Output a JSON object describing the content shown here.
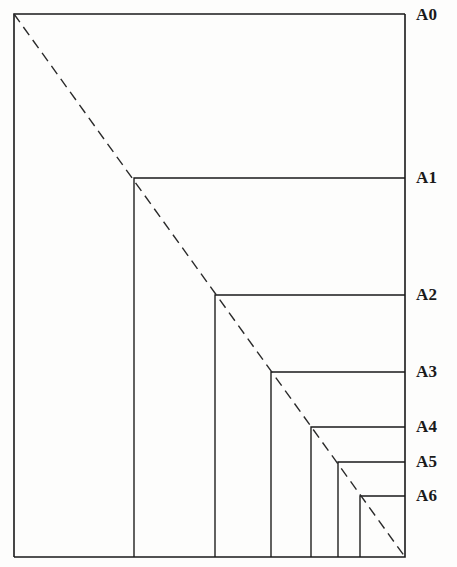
{
  "figure": {
    "kind": "a-series-paper-size-nested-rectangles",
    "background_color": "#fdfdfc",
    "line_color": "#1a1a1a",
    "label_color": "#1a1a1a",
    "canvas": {
      "width": 457,
      "height": 567
    }
  },
  "frame": {
    "left": 14,
    "top": 14,
    "right": 405,
    "bottom": 557,
    "stroke_width": 1.6
  },
  "diagonal": {
    "name": "dashed-diagonal",
    "x1": 14,
    "y1": 14,
    "x2": 405,
    "y2": 557,
    "dash": "10 6",
    "stroke_width": 1.4,
    "color": "#2a2a2a"
  },
  "labels": [
    {
      "id": "A0",
      "text": "A0",
      "x": 416,
      "y": 6
    },
    {
      "id": "A1",
      "text": "A1",
      "x": 416,
      "y": 169
    },
    {
      "id": "A2",
      "text": "A2",
      "x": 416,
      "y": 286
    },
    {
      "id": "A3",
      "text": "A3",
      "x": 416,
      "y": 363
    },
    {
      "id": "A4",
      "text": "A4",
      "x": 416,
      "y": 418
    },
    {
      "id": "A5",
      "text": "A5",
      "x": 416,
      "y": 453
    },
    {
      "id": "A6",
      "text": "A6",
      "x": 416,
      "y": 487
    }
  ],
  "rectangles": [
    {
      "id": "A0",
      "corner_x": 14,
      "corner_y": 14,
      "right": 405,
      "bottom": 557
    },
    {
      "id": "A1",
      "corner_x": 134,
      "corner_y": 178,
      "right": 405,
      "bottom": 557
    },
    {
      "id": "A2",
      "corner_x": 215,
      "corner_y": 295,
      "right": 405,
      "bottom": 557
    },
    {
      "id": "A3",
      "corner_x": 271,
      "corner_y": 372,
      "right": 405,
      "bottom": 557
    },
    {
      "id": "A4",
      "corner_x": 311,
      "corner_y": 427,
      "right": 405,
      "bottom": 557
    },
    {
      "id": "A5",
      "corner_x": 338,
      "corner_y": 462,
      "right": 405,
      "bottom": 557
    },
    {
      "id": "A6",
      "corner_x": 360,
      "corner_y": 496,
      "right": 405,
      "bottom": 557
    }
  ],
  "chart_data": {
    "type": "diagram",
    "title": "",
    "categories": [
      "A0",
      "A1",
      "A2",
      "A3",
      "A4",
      "A5",
      "A6"
    ],
    "series": [
      {
        "name": "width_px",
        "values": [
          391,
          271,
          190,
          134,
          94,
          67,
          45
        ]
      },
      {
        "name": "height_px",
        "values": [
          543,
          379,
          262,
          185,
          130,
          95,
          61
        ]
      }
    ],
    "xlabel": "",
    "ylabel": "",
    "grid": false,
    "legend": "right"
  }
}
